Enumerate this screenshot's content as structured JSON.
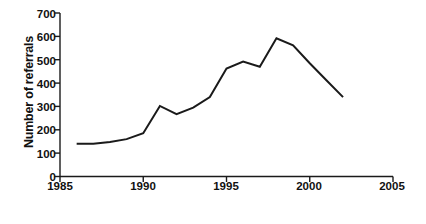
{
  "chart_data": {
    "type": "line",
    "title": "",
    "xlabel": "Year",
    "ylabel": "Number of referrals",
    "xlim": [
      1985,
      2005
    ],
    "ylim": [
      0,
      700
    ],
    "xticks": [
      1985,
      1990,
      1995,
      2000,
      2005
    ],
    "yticks": [
      0,
      100,
      200,
      300,
      400,
      500,
      600,
      700
    ],
    "xtick_labels": [
      "1985",
      "1990",
      "1995",
      "2000",
      "2005"
    ],
    "ytick_labels": [
      "0",
      "100",
      "200",
      "300",
      "400",
      "500",
      "600",
      "700"
    ],
    "grid": false,
    "legend": false,
    "legend_position": "none",
    "line_color": "#1a1a1a",
    "line_width": 2,
    "markers": false,
    "x": [
      1986,
      1987,
      1988,
      1989,
      1990,
      1991,
      1992,
      1993,
      1994,
      1995,
      1996,
      1997,
      1998,
      1999,
      2000,
      2001,
      2002
    ],
    "values": [
      140,
      140,
      148,
      160,
      185,
      302,
      267,
      295,
      340,
      462,
      492,
      470,
      592,
      562,
      485,
      412,
      340
    ],
    "series": [
      {
        "name": "Number of referrals",
        "values": [
          140,
          140,
          148,
          160,
          185,
          302,
          267,
          295,
          340,
          462,
          492,
          470,
          592,
          562,
          485,
          412,
          340
        ]
      }
    ]
  },
  "axes": {
    "y_title": "Number of referrals",
    "x_title": "Year"
  },
  "caption": {
    "text": ""
  }
}
